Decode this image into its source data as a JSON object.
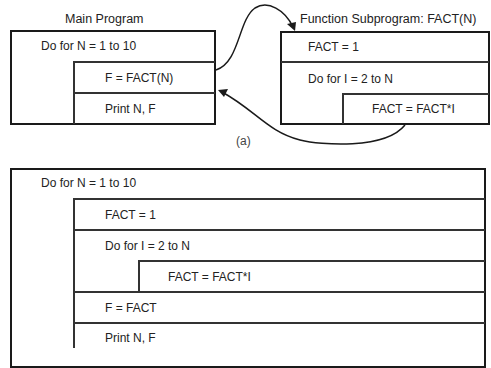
{
  "diagram_a": {
    "caption": "(a)",
    "main_program": {
      "title": "Main Program",
      "outer_loop": "Do for N = 1 to 10",
      "call": "F = FACT(N)",
      "print": "Print N, F"
    },
    "function_subprogram": {
      "title": "Function Subprogram: FACT(N)",
      "init": "FACT = 1",
      "inner_loop": "Do for I = 2 to N",
      "multiply": "FACT = FACT*I"
    }
  },
  "diagram_b": {
    "outer_loop": "Do for N = 1 to 10",
    "init": "FACT = 1",
    "inner_loop": "Do for I = 2 to N",
    "multiply": "FACT = FACT*I",
    "assign": "F = FACT",
    "print": "Print N, F"
  },
  "colors": {
    "line": "#1a1a1a",
    "text": "#222222",
    "background": "#ffffff"
  }
}
